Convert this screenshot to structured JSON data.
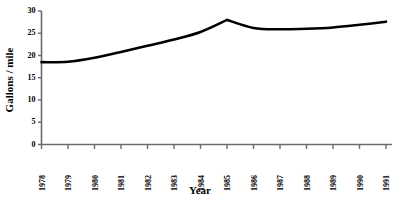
{
  "chart_data": {
    "type": "line",
    "title": "",
    "xlabel": "Year",
    "ylabel": "Gallons / mile",
    "x": [
      1978,
      1979,
      1980,
      1981,
      1982,
      1983,
      1984,
      1985,
      1986,
      1987,
      1988,
      1989,
      1990,
      1991
    ],
    "categories": [
      "1978",
      "1979",
      "1980",
      "1981",
      "1982",
      "1983",
      "1984",
      "1985",
      "1986",
      "1987",
      "1988",
      "1989",
      "1990",
      "1991"
    ],
    "values": [
      18.5,
      18.6,
      19.5,
      20.8,
      22.2,
      23.6,
      25.3,
      28.0,
      26.2,
      25.9,
      26.0,
      26.3,
      26.9,
      27.6
    ],
    "series": [
      {
        "name": "Gallons / mile",
        "values": [
          18.5,
          18.6,
          19.5,
          20.8,
          22.2,
          23.6,
          25.3,
          28.0,
          26.2,
          25.9,
          26.0,
          26.3,
          26.9,
          27.6
        ],
        "color": "#000000"
      }
    ],
    "xlim": [
      1978,
      1991
    ],
    "ylim": [
      0,
      30
    ],
    "yticks": [
      0,
      5,
      10,
      15,
      20,
      25,
      30
    ],
    "ytick_labels": [
      "0",
      "5",
      "10",
      "15",
      "20",
      "25",
      "30"
    ],
    "xticks": [
      1978,
      1979,
      1980,
      1981,
      1982,
      1983,
      1984,
      1985,
      1986,
      1987,
      1988,
      1989,
      1990,
      1991
    ],
    "xtick_labels": [
      "1978",
      "1979",
      "1980",
      "1981",
      "1982",
      "1983",
      "1984",
      "1985",
      "1986",
      "1987",
      "1988",
      "1989",
      "1990",
      "1991"
    ],
    "xtick_rotation": 90,
    "grid": false,
    "legend": false,
    "legend_position": "none",
    "line_width": 2.6,
    "smooth": true,
    "background_color": "#ffffff",
    "axis_color": "#6b6b6b",
    "text_color": "#000000",
    "annotations": []
  }
}
